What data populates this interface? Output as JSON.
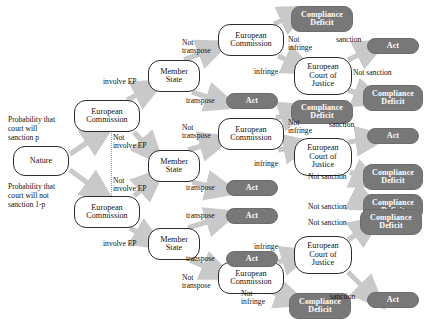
{
  "diagram": {
    "type": "extensive-form-game-tree",
    "title": "",
    "colors": {
      "arrow": "#c9c9c9",
      "terminal_fill": "#787878",
      "terminal_text": "#ffffff",
      "decision_fill": "#ffffff",
      "decision_border": "#2b2b2b",
      "background": "#ffffff"
    },
    "nodes": [
      {
        "id": "nature",
        "label": "Nature",
        "kind": "decision",
        "x": 13,
        "y": 146,
        "w": 56,
        "h": 30
      },
      {
        "id": "ec_top",
        "label": "European\nCommission",
        "kind": "decision",
        "x": 74,
        "y": 100,
        "w": 66,
        "h": 32
      },
      {
        "id": "ec_bot",
        "label": "European\nCommission",
        "kind": "decision",
        "x": 74,
        "y": 196,
        "w": 66,
        "h": 32
      },
      {
        "id": "ms1",
        "label": "Member\nState",
        "kind": "decision",
        "x": 148,
        "y": 60,
        "w": 52,
        "h": 32
      },
      {
        "id": "ms2",
        "label": "Member\nState",
        "kind": "decision",
        "x": 148,
        "y": 150,
        "w": 52,
        "h": 32
      },
      {
        "id": "ms3",
        "label": "Member\nState",
        "kind": "decision",
        "x": 148,
        "y": 228,
        "w": 52,
        "h": 32
      },
      {
        "id": "ec1",
        "label": "European\nCommission",
        "kind": "decision",
        "x": 218,
        "y": 24,
        "w": 66,
        "h": 32
      },
      {
        "id": "ec2",
        "label": "European\nCommission",
        "kind": "decision",
        "x": 218,
        "y": 118,
        "w": 66,
        "h": 32
      },
      {
        "id": "ec3",
        "label": "European\nCommission",
        "kind": "decision",
        "x": 218,
        "y": 262,
        "w": 66,
        "h": 32
      },
      {
        "id": "ecj1",
        "label": "European\nCourt  of\nJustice",
        "kind": "decision",
        "x": 294,
        "y": 57,
        "w": 58,
        "h": 38
      },
      {
        "id": "ecj2",
        "label": "European\nCourt  of\nJustice",
        "kind": "decision",
        "x": 294,
        "y": 138,
        "w": 58,
        "h": 38
      },
      {
        "id": "ecj3",
        "label": "European\nCourt  of\nJustice",
        "kind": "decision",
        "x": 294,
        "y": 236,
        "w": 58,
        "h": 38
      },
      {
        "id": "t_cd1",
        "label": "Compliance\nDeficit",
        "kind": "terminal",
        "x": 291,
        "y": 6,
        "w": 62,
        "h": 26
      },
      {
        "id": "t_act1",
        "label": "Act",
        "kind": "terminal",
        "x": 367,
        "y": 38,
        "w": 52,
        "h": 16
      },
      {
        "id": "t_cd2",
        "label": "Compliance\nDeficit",
        "kind": "terminal",
        "x": 363,
        "y": 85,
        "w": 60,
        "h": 26
      },
      {
        "id": "t_act2",
        "label": "Act",
        "kind": "terminal",
        "x": 226,
        "y": 93,
        "w": 52,
        "h": 16
      },
      {
        "id": "t_cd3",
        "label": "Compliance\nDeficit",
        "kind": "terminal",
        "x": 291,
        "y": 100,
        "w": 62,
        "h": 24
      },
      {
        "id": "t_act3",
        "label": "Act",
        "kind": "terminal",
        "x": 367,
        "y": 128,
        "w": 52,
        "h": 16
      },
      {
        "id": "t_cd4",
        "label": "Compliance\nDeficit",
        "kind": "terminal",
        "x": 363,
        "y": 164,
        "w": 60,
        "h": 26
      },
      {
        "id": "t_cd5",
        "label": "Compliance\nDeficit",
        "kind": "terminal",
        "x": 363,
        "y": 194,
        "w": 60,
        "h": 26
      },
      {
        "id": "t_act4",
        "label": "Act",
        "kind": "terminal",
        "x": 226,
        "y": 180,
        "w": 52,
        "h": 16
      },
      {
        "id": "t_act5",
        "label": "Act",
        "kind": "terminal",
        "x": 226,
        "y": 208,
        "w": 52,
        "h": 16
      },
      {
        "id": "t_act6",
        "label": "Act",
        "kind": "terminal",
        "x": 226,
        "y": 251,
        "w": 52,
        "h": 16
      },
      {
        "id": "t_cd6",
        "label": "Compliance\nDeficit",
        "kind": "terminal",
        "x": 360,
        "y": 209,
        "w": 62,
        "h": 26
      },
      {
        "id": "t_act7",
        "label": "Act",
        "kind": "terminal",
        "x": 367,
        "y": 292,
        "w": 52,
        "h": 16
      },
      {
        "id": "t_cd7",
        "label": "Compliance\nDeficit",
        "kind": "terminal",
        "x": 289,
        "y": 293,
        "w": 62,
        "h": 26
      }
    ],
    "edge_labels": [
      {
        "id": "prob_top",
        "text": "Probability that\ncourt will\nsanction p",
        "x": 8,
        "y": 116,
        "w": 70,
        "align": "left"
      },
      {
        "id": "prob_bot",
        "text": "Probability that\ncourt will not\nsanction 1-p",
        "x": 8,
        "y": 183,
        "w": 72,
        "align": "left"
      },
      {
        "id": "l_involve1",
        "text": "involve EP",
        "x": 104,
        "y": 78,
        "w": 44,
        "align": "left"
      },
      {
        "id": "l_notinvolve1",
        "text": "Not\ninvolve EP",
        "x": 112,
        "y": 134,
        "w": 42,
        "align": "left"
      },
      {
        "id": "l_notinvolve2",
        "text": "Not\ninvolve EP",
        "x": 112,
        "y": 177,
        "w": 42,
        "align": "left"
      },
      {
        "id": "l_involve2",
        "text": "involve EP",
        "x": 104,
        "y": 240,
        "w": 44,
        "align": "left"
      },
      {
        "id": "l_nottrans1",
        "text": "Not\ntranspose",
        "x": 183,
        "y": 39,
        "w": 36,
        "align": "left"
      },
      {
        "id": "l_trans1",
        "text": "transpose",
        "x": 187,
        "y": 97,
        "w": 38,
        "align": "left"
      },
      {
        "id": "l_nottrans2",
        "text": "Not\ntranspose",
        "x": 183,
        "y": 124,
        "w": 36,
        "align": "left"
      },
      {
        "id": "l_trans2",
        "text": "transpose",
        "x": 187,
        "y": 184,
        "w": 38,
        "align": "left"
      },
      {
        "id": "l_trans3",
        "text": "transpose",
        "x": 187,
        "y": 212,
        "w": 38,
        "align": "left"
      },
      {
        "id": "l_trans4",
        "text": "transpose",
        "x": 187,
        "y": 255,
        "w": 38,
        "align": "left"
      },
      {
        "id": "l_nottrans3",
        "text": "Not\ntranspose",
        "x": 183,
        "y": 274,
        "w": 36,
        "align": "left"
      },
      {
        "id": "l_notinf1",
        "text": "Not\ninfringe",
        "x": 288,
        "y": 36,
        "w": 32,
        "align": "left"
      },
      {
        "id": "l_inf1",
        "text": "infringe",
        "x": 255,
        "y": 68,
        "w": 32,
        "align": "left"
      },
      {
        "id": "l_notinf2",
        "text": "Not\ninfringe",
        "x": 288,
        "y": 119,
        "w": 32,
        "align": "left"
      },
      {
        "id": "l_inf2",
        "text": "infringe",
        "x": 255,
        "y": 160,
        "w": 32,
        "align": "left"
      },
      {
        "id": "l_inf3",
        "text": "infringe",
        "x": 255,
        "y": 243,
        "w": 32,
        "align": "left"
      },
      {
        "id": "l_notinf3",
        "text": "Not\ninfringe",
        "x": 243,
        "y": 290,
        "w": 32,
        "align": "left"
      },
      {
        "id": "l_sanc1",
        "text": "sanction",
        "x": 337,
        "y": 36,
        "w": 36,
        "align": "left"
      },
      {
        "id": "l_notsanc1",
        "text": "Not sanction",
        "x": 355,
        "y": 69,
        "w": 50,
        "align": "left"
      },
      {
        "id": "l_sanc2",
        "text": "sanction",
        "x": 330,
        "y": 121,
        "w": 36,
        "align": "left"
      },
      {
        "id": "l_notsanc2",
        "text": "Not sanction",
        "x": 310,
        "y": 173,
        "w": 50,
        "align": "left"
      },
      {
        "id": "l_notsanc3",
        "text": "Not sanction",
        "x": 310,
        "y": 203,
        "w": 50,
        "align": "left"
      },
      {
        "id": "l_notsanc4",
        "text": "Not sanction",
        "x": 310,
        "y": 219,
        "w": 50,
        "align": "left"
      },
      {
        "id": "l_sanc3",
        "text": "sanction",
        "x": 331,
        "y": 293,
        "w": 36,
        "align": "left"
      }
    ],
    "edges": [
      {
        "from": "nature",
        "to": "ec_top",
        "label": "Probability that court will sanction p"
      },
      {
        "from": "nature",
        "to": "ec_bot",
        "label": "Probability that court will not sanction 1-p"
      },
      {
        "from": "ec_top",
        "to": "ms1",
        "label": "involve EP"
      },
      {
        "from": "ec_top",
        "to": "ms2",
        "label": "Not involve EP"
      },
      {
        "from": "ec_bot",
        "to": "ms2",
        "label": "Not involve EP"
      },
      {
        "from": "ec_bot",
        "to": "ms3",
        "label": "involve EP"
      },
      {
        "from": "ms1",
        "to": "ec1",
        "label": "Not transpose"
      },
      {
        "from": "ms1",
        "to": "t_act2",
        "label": "transpose"
      },
      {
        "from": "ms2",
        "to": "ec2",
        "label": "Not transpose"
      },
      {
        "from": "ms2",
        "to": "t_act4",
        "label": "transpose"
      },
      {
        "from": "ms3",
        "to": "t_act6",
        "label": "transpose"
      },
      {
        "from": "ms3",
        "to": "ec3",
        "label": "Not transpose"
      },
      {
        "from": "ec1",
        "to": "t_cd1",
        "label": "Not infringe"
      },
      {
        "from": "ec1",
        "to": "ecj1",
        "label": "infringe"
      },
      {
        "from": "ec2",
        "to": "t_cd3",
        "label": "Not infringe"
      },
      {
        "from": "ec2",
        "to": "ecj2",
        "label": "infringe"
      },
      {
        "from": "ec3",
        "to": "ecj3",
        "label": "infringe"
      },
      {
        "from": "ec3",
        "to": "t_cd7",
        "label": "Not infringe"
      },
      {
        "from": "ecj1",
        "to": "t_act1",
        "label": "sanction"
      },
      {
        "from": "ecj1",
        "to": "t_cd2",
        "label": "Not sanction"
      },
      {
        "from": "ecj2",
        "to": "t_act3",
        "label": "sanction"
      },
      {
        "from": "ecj2",
        "to": "t_cd4",
        "label": "Not sanction"
      },
      {
        "from": "ecj3",
        "to": "t_cd6",
        "label": "Not sanction"
      },
      {
        "from": "ecj3",
        "to": "t_act7",
        "label": "sanction"
      }
    ]
  }
}
